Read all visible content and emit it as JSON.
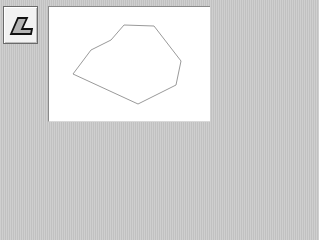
{
  "toolbar": {
    "tools": [
      {
        "name": "polygon-tool",
        "icon": "polygon-tool-icon",
        "selected": true
      }
    ]
  },
  "canvas": {
    "background": "#ffffff",
    "shapes": [
      {
        "type": "polygon",
        "stroke": "#9a9a9a",
        "fill": "none",
        "points": [
          [
            73,
            74
          ],
          [
            91,
            50
          ],
          [
            111,
            40
          ],
          [
            124,
            25
          ],
          [
            154,
            26
          ],
          [
            181,
            61
          ],
          [
            176,
            85
          ],
          [
            138,
            104
          ]
        ]
      }
    ]
  },
  "colors": {
    "panel_bg": "#c9c9c9",
    "button_bg": "#f2f2f2",
    "icon_fill": "#b4b4b4",
    "icon_stroke": "#111111",
    "shape_stroke": "#9a9a9a"
  }
}
